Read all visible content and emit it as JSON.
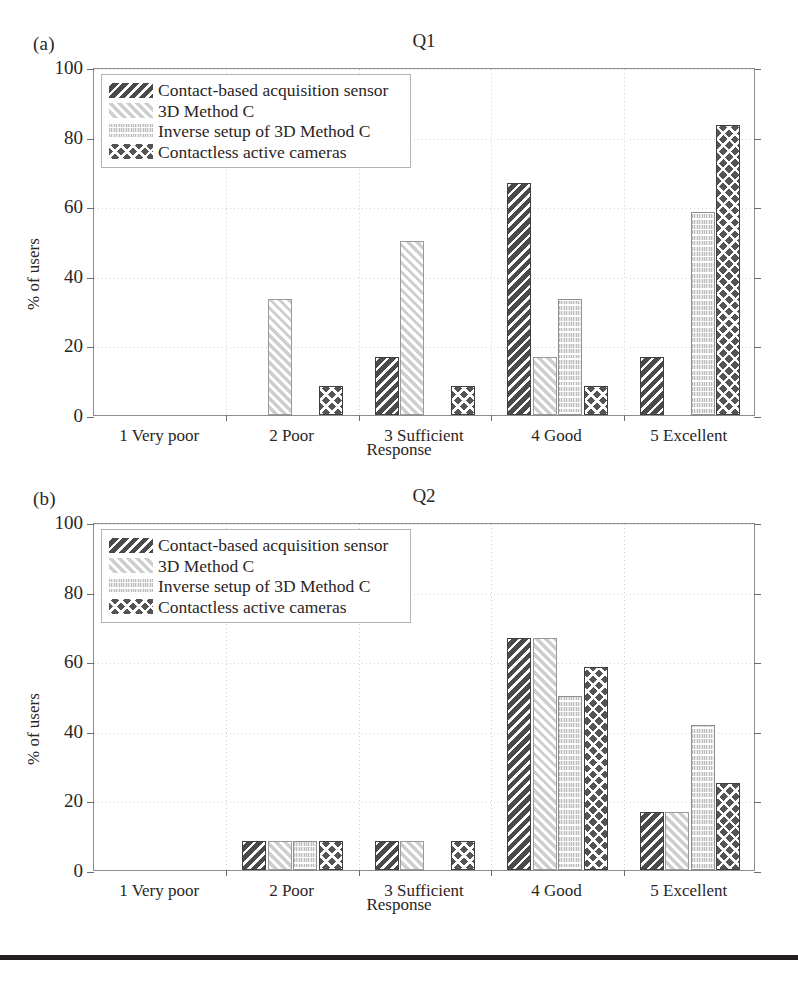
{
  "figure": {
    "footer_rule_color": "#231f20",
    "panels": [
      {
        "panel_label": "(a)",
        "title": "Q1"
      },
      {
        "panel_label": "(b)",
        "title": "Q2"
      }
    ]
  },
  "axis": {
    "ylabel": "% of users",
    "xlabel": "Response",
    "ytick_labels": [
      "0",
      "20",
      "40",
      "60",
      "80",
      "100"
    ],
    "xtick_labels": [
      "1 Very poor",
      "2 Poor",
      "3 Sufficient",
      "4 Good",
      "5 Excellent"
    ]
  },
  "legend": {
    "entries": [
      {
        "label": "Contact-based acquisition sensor",
        "pattern": "dark-diagonal-stripes"
      },
      {
        "label": "3D Method C",
        "pattern": "light-diagonal-stripes"
      },
      {
        "label": "Inverse setup of 3D Method C",
        "pattern": "light-dotted-mesh"
      },
      {
        "label": "Contactless active cameras",
        "pattern": "dark-crosshatch"
      }
    ]
  },
  "chart_data": [
    {
      "type": "bar",
      "title": "Q1",
      "panel_label": "(a)",
      "xlabel": "Response",
      "ylabel": "% of users",
      "ylim": [
        0,
        100
      ],
      "yticks": [
        0,
        20,
        40,
        60,
        80,
        100
      ],
      "grid": true,
      "legend_position": "upper left",
      "categories": [
        "1 Very poor",
        "2 Poor",
        "3 Sufficient",
        "4 Good",
        "5 Excellent"
      ],
      "series": [
        {
          "name": "Contact-based acquisition sensor",
          "values": [
            0,
            0,
            16.7,
            66.7,
            16.7
          ]
        },
        {
          "name": "3D Method C",
          "values": [
            0,
            33.3,
            50.0,
            16.7,
            0
          ]
        },
        {
          "name": "Inverse setup of 3D Method C",
          "values": [
            0,
            0,
            0,
            33.3,
            58.3
          ]
        },
        {
          "name": "Contactless active cameras",
          "values": [
            0,
            8.3,
            8.3,
            8.3,
            83.3
          ]
        }
      ]
    },
    {
      "type": "bar",
      "title": "Q2",
      "panel_label": "(b)",
      "xlabel": "Response",
      "ylabel": "% of users",
      "ylim": [
        0,
        100
      ],
      "yticks": [
        0,
        20,
        40,
        60,
        80,
        100
      ],
      "grid": true,
      "legend_position": "upper left",
      "categories": [
        "1 Very poor",
        "2 Poor",
        "3 Sufficient",
        "4 Good",
        "5 Excellent"
      ],
      "series": [
        {
          "name": "Contact-based acquisition sensor",
          "values": [
            0,
            8.3,
            8.3,
            66.7,
            16.7
          ]
        },
        {
          "name": "3D Method C",
          "values": [
            0,
            8.3,
            8.3,
            66.7,
            16.7
          ]
        },
        {
          "name": "Inverse setup of 3D Method C",
          "values": [
            0,
            8.3,
            0,
            50.0,
            41.7
          ]
        },
        {
          "name": "Contactless active cameras",
          "values": [
            0,
            8.3,
            8.3,
            58.3,
            25.0
          ]
        }
      ]
    }
  ]
}
